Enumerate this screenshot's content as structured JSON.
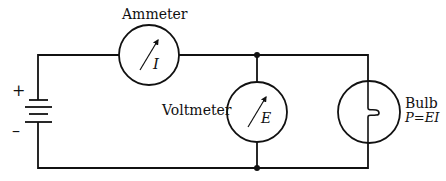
{
  "diagram": {
    "type": "circuit",
    "colors": {
      "stroke": "#111111",
      "background": "#ffffff"
    },
    "battery": {
      "plus_label": "+",
      "minus_label": "–"
    },
    "ammeter": {
      "label": "Ammeter",
      "symbol": "I"
    },
    "voltmeter": {
      "label": "Voltmeter",
      "symbol": "E"
    },
    "bulb": {
      "label": "Bulb",
      "formula": "P=EI"
    }
  }
}
